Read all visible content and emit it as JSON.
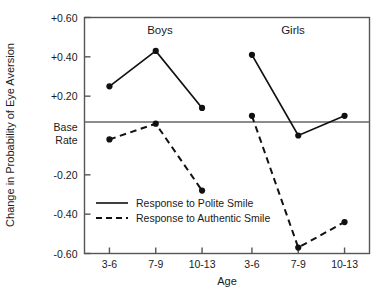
{
  "chart_data": {
    "type": "line",
    "title": "",
    "xlabel": "Age",
    "ylabel": "Change in Probability of Eye Aversion",
    "ylim": [
      -0.6,
      0.6
    ],
    "grid": false,
    "baseline_label_line1": "Base",
    "baseline_label_line2": "Rate",
    "baseline_value": 0.0,
    "ytick_labels": [
      "+0.60",
      "+0.40",
      "+0.20",
      "Base Rate",
      "-0.20",
      "-0.40",
      "-0.60"
    ],
    "ytick_values": [
      0.6,
      0.4,
      0.2,
      0.0,
      -0.2,
      -0.4,
      -0.6
    ],
    "categories": [
      "3-6",
      "7-9",
      "10-13"
    ],
    "panels": [
      {
        "name": "Boys",
        "categories": [
          "3-6",
          "7-9",
          "10-13"
        ],
        "series": [
          {
            "name": "Response to Polite Smile",
            "style": "solid",
            "values": [
              0.25,
              0.43,
              0.14
            ]
          },
          {
            "name": "Response to Authentic Smile",
            "style": "dashed",
            "values": [
              -0.02,
              0.06,
              -0.28
            ]
          }
        ]
      },
      {
        "name": "Girls",
        "categories": [
          "3-6",
          "7-9",
          "10-13"
        ],
        "series": [
          {
            "name": "Response to Polite Smile",
            "style": "solid",
            "values": [
              0.41,
              0.0,
              0.1
            ]
          },
          {
            "name": "Response to Authentic Smile",
            "style": "dashed",
            "values": [
              0.1,
              -0.57,
              -0.44
            ]
          }
        ]
      }
    ],
    "legend": {
      "position": "inside-lower-left",
      "entries": [
        {
          "label": "Response to Polite Smile",
          "style": "solid"
        },
        {
          "label": "Response to Authentic Smile",
          "style": "dashed"
        }
      ]
    },
    "colors": {
      "line": "#111111",
      "marker": "#111111",
      "axis": "#555555",
      "baseline": "#666666",
      "background": "#ffffff"
    }
  }
}
